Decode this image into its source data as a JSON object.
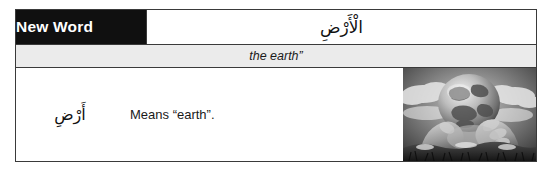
{
  "card": {
    "label": "New Word",
    "headword_arabic": "الْأَرْضِ",
    "translation": "the earth”",
    "definition_arabic": "أَرْضِ",
    "definition_gloss": "Means “earth”.",
    "image_alt": "earth-in-hands-photo"
  },
  "colors": {
    "label_background": "#101010",
    "label_text": "#ffffff",
    "translation_background": "#ebebeb",
    "border": "#3a3a3a",
    "page_background": "#ffffff"
  }
}
